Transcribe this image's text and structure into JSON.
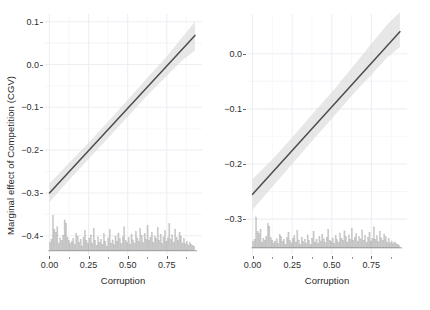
{
  "figure": {
    "width": 430,
    "height": 310,
    "background": "#ffffff",
    "shared_y_axis_title": "Marginal effect of Competition (CGV)",
    "line_color": "#4d4d4d",
    "band_color": "#d9d9d9",
    "grid_major_color": "#eceff4",
    "grid_minor_color": "#f4f6f9",
    "rug_color": "#9e9e9e",
    "tick_color": "#666666",
    "text_color": "#2e2e2e"
  },
  "chart_data": [
    {
      "type": "line",
      "panel": "left",
      "title": "",
      "xlabel": "Corruption",
      "ylabel": "Marginal effect of Competition (CGV)",
      "xlim": [
        -0.035,
        0.975
      ],
      "ylim": [
        -0.445,
        0.118
      ],
      "xticks": [
        0.0,
        0.25,
        0.5,
        0.75
      ],
      "xticklabels": [
        "0.00",
        "0.25",
        "0.50",
        "0.75"
      ],
      "yticks": [
        0.1,
        0.0,
        -0.1,
        -0.2,
        -0.3,
        -0.4
      ],
      "yticklabels": [
        "0.1",
        "0.0",
        "-0.1",
        "-0.2",
        "-0.3",
        "-0.4"
      ],
      "grid": true,
      "grid_minor": true,
      "legend": "none",
      "series": [
        {
          "name": "marginal effect",
          "kind": "fit-line",
          "x": [
            0.0,
            0.93
          ],
          "y": [
            -0.3,
            0.068
          ]
        },
        {
          "name": "95% confidence band",
          "kind": "ribbon",
          "x": [
            0.0,
            0.12,
            0.25,
            0.4,
            0.5,
            0.62,
            0.75,
            0.85,
            0.93
          ],
          "ylower": [
            -0.322,
            -0.272,
            -0.221,
            -0.162,
            -0.122,
            -0.074,
            -0.026,
            0.01,
            0.033
          ],
          "yupper": [
            -0.278,
            -0.232,
            -0.183,
            -0.123,
            -0.083,
            -0.033,
            0.019,
            0.064,
            0.1
          ]
        }
      ],
      "rug": {
        "kind": "histogram-rug",
        "baseline": -0.435,
        "top_max": -0.345,
        "bin_width": 0.0093,
        "heights": [
          0.22,
          0.3,
          0.92,
          0.55,
          0.48,
          0.62,
          0.2,
          0.33,
          0.27,
          0.4,
          0.8,
          0.72,
          0.35,
          0.26,
          0.18,
          0.24,
          0.31,
          0.16,
          0.45,
          0.38,
          0.22,
          0.29,
          0.12,
          0.35,
          0.52,
          0.26,
          0.18,
          0.33,
          0.41,
          0.2,
          0.58,
          0.27,
          0.14,
          0.36,
          0.22,
          0.3,
          0.17,
          0.44,
          0.25,
          0.12,
          0.33,
          0.55,
          0.2,
          0.28,
          0.16,
          0.38,
          0.24,
          0.46,
          0.31,
          0.19,
          0.36,
          0.62,
          0.27,
          0.22,
          0.34,
          0.17,
          0.42,
          0.28,
          0.2,
          0.5,
          0.33,
          0.25,
          0.57,
          0.39,
          0.21,
          0.44,
          0.3,
          0.65,
          0.26,
          0.35,
          0.48,
          0.22,
          0.38,
          0.31,
          0.6,
          0.27,
          0.43,
          0.19,
          0.36,
          0.52,
          0.24,
          0.33,
          0.7,
          0.29,
          0.41,
          0.22,
          0.56,
          0.34,
          0.26,
          0.47,
          0.38,
          0.2,
          0.32,
          0.18,
          0.24,
          0.15,
          0.21,
          0.17,
          0.13,
          0.11
        ]
      }
    },
    {
      "type": "line",
      "panel": "right",
      "title": "",
      "xlabel": "Corruption",
      "ylabel": "",
      "xlim": [
        -0.035,
        0.975
      ],
      "ylim": [
        -0.365,
        0.072
      ],
      "xticks": [
        0.0,
        0.25,
        0.5,
        0.75
      ],
      "xticklabels": [
        "0.00",
        "0.25",
        "0.50",
        "0.75"
      ],
      "yticks": [
        0.0,
        -0.1,
        -0.2,
        -0.3
      ],
      "yticklabels": [
        "0.0",
        "-0.1",
        "-0.2",
        "-0.3"
      ],
      "grid": true,
      "grid_minor": true,
      "legend": "none",
      "series": [
        {
          "name": "marginal effect",
          "kind": "fit-line",
          "x": [
            0.0,
            0.93
          ],
          "y": [
            -0.255,
            0.04
          ]
        },
        {
          "name": "95% confidence band",
          "kind": "ribbon",
          "x": [
            0.0,
            0.12,
            0.25,
            0.4,
            0.5,
            0.62,
            0.75,
            0.85,
            0.93
          ],
          "ylower": [
            -0.283,
            -0.243,
            -0.2,
            -0.15,
            -0.118,
            -0.078,
            -0.038,
            -0.007,
            0.012
          ],
          "yupper": [
            -0.227,
            -0.193,
            -0.152,
            -0.102,
            -0.07,
            -0.028,
            0.018,
            0.053,
            0.075
          ]
        }
      ],
      "rug": {
        "kind": "histogram-rug",
        "baseline": -0.352,
        "top_max": -0.296,
        "bin_width": 0.0093,
        "heights": [
          0.2,
          0.28,
          1.0,
          0.52,
          0.46,
          0.6,
          0.18,
          0.31,
          0.25,
          0.38,
          0.78,
          0.7,
          0.33,
          0.24,
          0.16,
          0.22,
          0.29,
          0.14,
          0.43,
          0.36,
          0.2,
          0.27,
          0.1,
          0.33,
          0.5,
          0.24,
          0.16,
          0.31,
          0.39,
          0.18,
          0.56,
          0.25,
          0.12,
          0.34,
          0.2,
          0.28,
          0.15,
          0.42,
          0.23,
          0.1,
          0.31,
          0.53,
          0.18,
          0.26,
          0.14,
          0.36,
          0.22,
          0.44,
          0.29,
          0.17,
          0.34,
          0.6,
          0.25,
          0.2,
          0.32,
          0.15,
          0.4,
          0.26,
          0.18,
          0.48,
          0.31,
          0.23,
          0.55,
          0.37,
          0.19,
          0.42,
          0.28,
          0.63,
          0.24,
          0.33,
          0.46,
          0.2,
          0.36,
          0.29,
          0.58,
          0.25,
          0.41,
          0.17,
          0.34,
          0.5,
          0.22,
          0.31,
          0.68,
          0.27,
          0.39,
          0.2,
          0.54,
          0.32,
          0.24,
          0.45,
          0.36,
          0.18,
          0.3,
          0.16,
          0.22,
          0.13,
          0.19,
          0.15,
          0.11,
          0.09
        ]
      }
    }
  ]
}
